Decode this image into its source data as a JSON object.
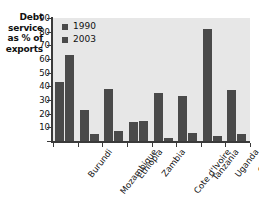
{
  "chart_data": {
    "type": "bar",
    "title": "",
    "xlabel": "",
    "ylabel": "Debt service as % of exports",
    "ylabel_lines": [
      "Debt",
      "service",
      "as % of",
      "exports"
    ],
    "ylim": [
      0,
      90
    ],
    "yticks": [
      90,
      80,
      70,
      60,
      50,
      40,
      30,
      20,
      10,
      0
    ],
    "ytick_labels": [
      "90",
      "80",
      "70",
      "60",
      "50",
      "40",
      "30",
      "20",
      "10",
      ""
    ],
    "grid": false,
    "legend_position": "top-left-inside",
    "categories": [
      "Burundi",
      "Mozambique",
      "Ethiopia",
      "Zambia",
      "Cote d'Ivoire",
      "Tanzania",
      "Uganda",
      "Ghana"
    ],
    "series": [
      {
        "name": "1990",
        "color": "#4a4a4a",
        "values": [
          43,
          23,
          38,
          14,
          35,
          33,
          82,
          37
        ]
      },
      {
        "name": "2003",
        "color": "#4a4a4a",
        "values": [
          63,
          5,
          7,
          15,
          2,
          6,
          4,
          5
        ]
      }
    ]
  },
  "legend": {
    "items": [
      {
        "label": "1990",
        "swatch": "#4a4a4a"
      },
      {
        "label": "2003",
        "swatch": "#4a4a4a"
      }
    ]
  },
  "colors": {
    "bar": "#4a4a4a",
    "plot_background": "#e7e7e7",
    "axis": "#3a3a3a",
    "page_background": "#ffffff",
    "text": "#111111"
  }
}
